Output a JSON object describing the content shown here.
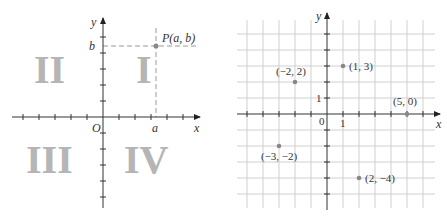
{
  "left_diagram": {
    "axis_x_label": "x",
    "axis_y_label": "y",
    "origin_label": "O",
    "point_label": "P(a, b)",
    "a_label": "a",
    "b_label": "b",
    "quadrants": [
      "I",
      "II",
      "III",
      "IV"
    ]
  },
  "right_diagram": {
    "axis_x_label": "x",
    "axis_y_label": "y",
    "origin_label": "0",
    "unit_x_label": "1",
    "unit_y_label": "1",
    "points": [
      {
        "label": "(1, 3)",
        "x": 1,
        "y": 3
      },
      {
        "label": "(−2, 2)",
        "x": -2,
        "y": 2
      },
      {
        "label": "(5, 0)",
        "x": 5,
        "y": 0
      },
      {
        "label": "(−3, −2)",
        "x": -3,
        "y": -2
      },
      {
        "label": "(2, −4)",
        "x": 2,
        "y": -4
      }
    ]
  },
  "colors": {
    "axis": "#333333",
    "grid": "#d0d0d0",
    "roman": "#b5b5b5",
    "point": "#888888",
    "dash": "#999999"
  }
}
